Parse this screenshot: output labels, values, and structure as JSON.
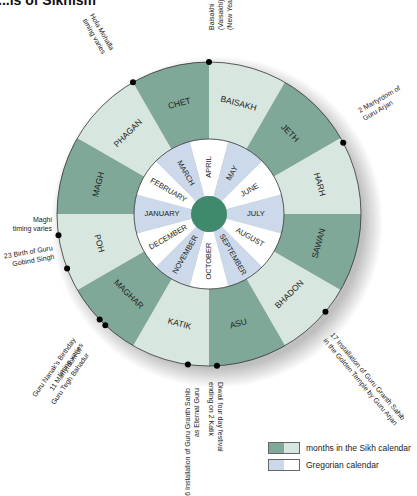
{
  "title": "...ls of Sikhism",
  "colors": {
    "sikh_dark": "#7fa898",
    "sikh_light": "#d7e7df",
    "greg_blue": "#cbd9ea",
    "greg_white": "#ffffff",
    "center": "#3f8a6c",
    "outline": "#333333"
  },
  "sikh_months": [
    {
      "label": "BAISAKH",
      "shade": "light"
    },
    {
      "label": "JETH",
      "shade": "dark"
    },
    {
      "label": "HARH",
      "shade": "light"
    },
    {
      "label": "SAWAN",
      "shade": "dark"
    },
    {
      "label": "BHADON",
      "shade": "light"
    },
    {
      "label": "ASU",
      "shade": "dark"
    },
    {
      "label": "KATIK",
      "shade": "light"
    },
    {
      "label": "MAGHAR",
      "shade": "dark"
    },
    {
      "label": "POH",
      "shade": "light"
    },
    {
      "label": "MAGH",
      "shade": "dark"
    },
    {
      "label": "PHAGAN",
      "shade": "light"
    },
    {
      "label": "CHET",
      "shade": "dark"
    }
  ],
  "gregorian_months": [
    {
      "label": "APRIL",
      "shade": "white"
    },
    {
      "label": "MAY",
      "shade": "blue"
    },
    {
      "label": "JUNE",
      "shade": "white"
    },
    {
      "label": "JULY",
      "shade": "blue"
    },
    {
      "label": "AUGUST",
      "shade": "white"
    },
    {
      "label": "SEPTEMBER",
      "shade": "blue"
    },
    {
      "label": "OCTOBER",
      "shade": "white"
    },
    {
      "label": "NOVEMBER",
      "shade": "blue"
    },
    {
      "label": "DECEMBER",
      "shade": "white"
    },
    {
      "label": "JANUARY",
      "shade": "blue"
    },
    {
      "label": "FEBRUARY",
      "shade": "white"
    },
    {
      "label": "MARCH",
      "shade": "blue"
    }
  ],
  "events": [
    {
      "lines": [
        "Hola Mohalla",
        "timing varies"
      ]
    },
    {
      "lines": [
        "Baisakhi",
        "(Vaisakhi)",
        "(New Year)"
      ]
    },
    {
      "lines": [
        "2 Martyrdom of",
        "Guru Arjan"
      ]
    },
    {
      "lines": [
        "17 Installation of Guru Granth Sahib",
        "in the Golden Temple by Guru Arjan"
      ]
    },
    {
      "lines": [
        "Diwali four day festival",
        "ending on 2 Katik"
      ]
    },
    {
      "lines": [
        "6 Installation of Guru Granth Sahib",
        "as Eternal Guru"
      ]
    },
    {
      "lines": [
        "Guru Nanak's Birthday",
        "timing varies"
      ]
    },
    {
      "lines": [
        "11 Martyrdom of",
        "Guru Tegh Bahadur"
      ]
    },
    {
      "lines": [
        "23 Birth of Guru",
        "Gobind Singh"
      ]
    },
    {
      "lines": [
        "Maghi",
        "timing varies"
      ]
    }
  ],
  "legend": [
    {
      "label": "months in the Sikh calendar"
    },
    {
      "label": "Gregorian calendar"
    }
  ]
}
